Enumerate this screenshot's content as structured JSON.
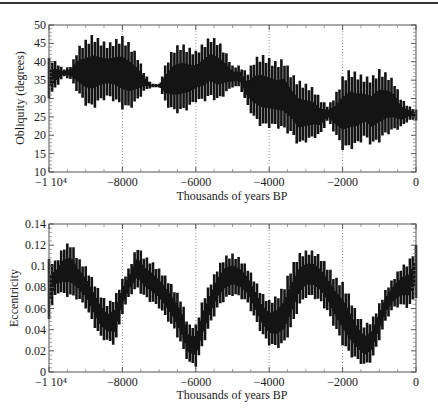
{
  "chart_data": [
    {
      "type": "line",
      "title": "",
      "xlabel": "Thousands of years BP",
      "ylabel": "Obliquity (degrees)",
      "xlim": [
        -10000,
        0
      ],
      "ylim": [
        10,
        50
      ],
      "grid": "vertical dotted at x ticks",
      "x_tick_labels": [
        "-1 10^4",
        "-8000",
        "-6000",
        "-4000",
        "-2000",
        "0"
      ],
      "x_ticks": [
        -10000,
        -8000,
        -6000,
        -4000,
        -2000,
        0
      ],
      "y_ticks": [
        10,
        15,
        20,
        25,
        30,
        35,
        40,
        45,
        50
      ],
      "description": "Rapidly oscillating series; envelope (min/max) sampled every 200 kyr",
      "x": [
        -10000,
        -9800,
        -9600,
        -9400,
        -9200,
        -9000,
        -8800,
        -8600,
        -8400,
        -8200,
        -8000,
        -7800,
        -7600,
        -7400,
        -7200,
        -7000,
        -6800,
        -6600,
        -6400,
        -6200,
        -6000,
        -5800,
        -5600,
        -5400,
        -5200,
        -5000,
        -4800,
        -4600,
        -4400,
        -4200,
        -4000,
        -3800,
        -3600,
        -3400,
        -3200,
        -3000,
        -2800,
        -2600,
        -2400,
        -2200,
        -2000,
        -1800,
        -1600,
        -1400,
        -1200,
        -1000,
        -800,
        -600,
        -400,
        -200,
        0
      ],
      "series": [
        {
          "name": "upper",
          "values": [
            41,
            40,
            38,
            39,
            44,
            46,
            47.5,
            46,
            45,
            46,
            47,
            45,
            42,
            37,
            34,
            34,
            40,
            44,
            45,
            44,
            43,
            45,
            47,
            46,
            43,
            39,
            39,
            37,
            41,
            42,
            41,
            40,
            41,
            37,
            35,
            34,
            33,
            30,
            28,
            31,
            36,
            38,
            37,
            36,
            36,
            38,
            37,
            35,
            30,
            28,
            27
          ]
        },
        {
          "name": "lower",
          "values": [
            30,
            33,
            36,
            35,
            31,
            28,
            27,
            29,
            30,
            29,
            27,
            27,
            29,
            32,
            33,
            33,
            28,
            26,
            26,
            27,
            29,
            29,
            30,
            29,
            31,
            33,
            33,
            28,
            24,
            22,
            22,
            22,
            21,
            20,
            17,
            18,
            19,
            20,
            24,
            20,
            16,
            16,
            17,
            19,
            17,
            18,
            20,
            21,
            22,
            24,
            24
          ]
        }
      ]
    },
    {
      "type": "line",
      "title": "",
      "xlabel": "Thousands of years BP",
      "ylabel": "Eccentricity",
      "xlim": [
        -10000,
        0
      ],
      "ylim": [
        0,
        0.14
      ],
      "grid": "vertical dotted at x ticks",
      "x_tick_labels": [
        "-1 10^4",
        "-8000",
        "-6000",
        "-4000",
        "-2000",
        "0"
      ],
      "x_ticks": [
        -10000,
        -8000,
        -6000,
        -4000,
        -2000,
        0
      ],
      "y_tick_labels": [
        "0",
        "0.02",
        "0.04",
        "0.06",
        "0.08",
        "0.1",
        "0.12",
        "0.14"
      ],
      "y_ticks": [
        0,
        0.02,
        0.04,
        0.06,
        0.08,
        0.1,
        0.12,
        0.14
      ],
      "description": "Rapidly oscillating series; envelope (min/max) sampled every 200 kyr",
      "x": [
        -10000,
        -9800,
        -9600,
        -9400,
        -9200,
        -9000,
        -8800,
        -8600,
        -8400,
        -8200,
        -8000,
        -7800,
        -7600,
        -7400,
        -7200,
        -7000,
        -6800,
        -6600,
        -6400,
        -6200,
        -6000,
        -5800,
        -5600,
        -5400,
        -5200,
        -5000,
        -4800,
        -4600,
        -4400,
        -4200,
        -4000,
        -3800,
        -3600,
        -3400,
        -3200,
        -3000,
        -2800,
        -2600,
        -2400,
        -2200,
        -2000,
        -1800,
        -1600,
        -1400,
        -1200,
        -1000,
        -800,
        -600,
        -400,
        -200,
        0
      ],
      "series": [
        {
          "name": "upper",
          "values": [
            0.107,
            0.105,
            0.12,
            0.123,
            0.108,
            0.1,
            0.088,
            0.075,
            0.065,
            0.072,
            0.088,
            0.1,
            0.12,
            0.11,
            0.105,
            0.098,
            0.09,
            0.08,
            0.07,
            0.045,
            0.045,
            0.07,
            0.085,
            0.1,
            0.11,
            0.112,
            0.108,
            0.1,
            0.088,
            0.075,
            0.068,
            0.072,
            0.082,
            0.1,
            0.112,
            0.115,
            0.115,
            0.11,
            0.1,
            0.09,
            0.085,
            0.072,
            0.055,
            0.045,
            0.05,
            0.065,
            0.08,
            0.09,
            0.1,
            0.105,
            0.12
          ]
        },
        {
          "name": "lower",
          "values": [
            0.05,
            0.075,
            0.072,
            0.07,
            0.068,
            0.06,
            0.045,
            0.032,
            0.028,
            0.025,
            0.055,
            0.072,
            0.078,
            0.07,
            0.065,
            0.06,
            0.05,
            0.04,
            0.025,
            0.008,
            0.005,
            0.025,
            0.045,
            0.06,
            0.068,
            0.072,
            0.07,
            0.065,
            0.05,
            0.035,
            0.025,
            0.022,
            0.025,
            0.04,
            0.06,
            0.07,
            0.07,
            0.065,
            0.055,
            0.04,
            0.025,
            0.015,
            0.01,
            0.005,
            0.01,
            0.03,
            0.05,
            0.06,
            0.062,
            0.06,
            0.07
          ]
        }
      ]
    }
  ],
  "labels": {
    "top_ylabel": "Obliquity (degrees)",
    "bottom_ylabel": "Eccentricity",
    "xlabel": "Thousands of years BP",
    "x_tick_labels": [
      "−1 10⁴",
      "−8000",
      "−6000",
      "−4000",
      "−2000",
      "0"
    ],
    "top_y_tick_labels": [
      "50",
      "45",
      "40",
      "35",
      "30",
      "25",
      "20",
      "15",
      "10"
    ],
    "bottom_y_tick_labels": [
      "0.14",
      "0.12",
      "0.1",
      "0.08",
      "0.06",
      "0.04",
      "0.02",
      "0"
    ]
  },
  "colors": {
    "series": "#141414",
    "axis": "#555555",
    "grid": "#777777"
  }
}
